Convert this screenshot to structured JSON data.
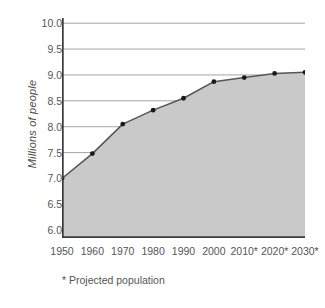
{
  "chart_data": {
    "type": "area",
    "title": "",
    "subtitle": "",
    "xlabel": "",
    "ylabel": "Millions of people",
    "categories": [
      "1950",
      "1960",
      "1970",
      "1980",
      "1990",
      "2000",
      "2010*",
      "2020*",
      "2030*"
    ],
    "x": [
      1950,
      1960,
      1970,
      1980,
      1990,
      2000,
      2010,
      2020,
      2030
    ],
    "values": [
      7.0,
      7.48,
      8.05,
      8.32,
      8.55,
      8.87,
      8.95,
      9.03,
      9.05
    ],
    "series": [
      {
        "name": "Population",
        "values": [
          7.0,
          7.48,
          8.05,
          8.32,
          8.55,
          8.87,
          8.95,
          9.03,
          9.05
        ]
      }
    ],
    "ylim": [
      5.85,
      10.1
    ],
    "xlim": [
      1950,
      2030
    ],
    "yticks": [
      10.0,
      9.5,
      9.0,
      8.5,
      8.0,
      7.5,
      7.0,
      6.5,
      6.0
    ],
    "ytick_labels": [
      "10.0",
      "9.5",
      "9.0",
      "8.5",
      "8.0",
      "7.5",
      "7.0",
      "6.5",
      "6.0"
    ],
    "grid": true,
    "grid_axis": "y",
    "legend": false,
    "legend_position": "none",
    "annotations": [
      "* Projected population"
    ],
    "fill_color": "#c9c9c9",
    "line_color": "#555555",
    "marker_color": "#1a1a1a",
    "grid_color": "#9a9a9a",
    "axis_color": "#3a3a3a",
    "background_color": "#ffffff"
  },
  "axes": {
    "y_title": "Millions of people",
    "y_tick_labels": [
      "10.0",
      "9.5",
      "9.0",
      "8.5",
      "8.0",
      "7.5",
      "7.0",
      "6.5",
      "6.0"
    ],
    "x_tick_labels": [
      "1950",
      "1960",
      "1970",
      "1980",
      "1990",
      "2000",
      "2010*",
      "2020*",
      "2030*"
    ]
  },
  "footnote": {
    "text": "* Projected population"
  }
}
